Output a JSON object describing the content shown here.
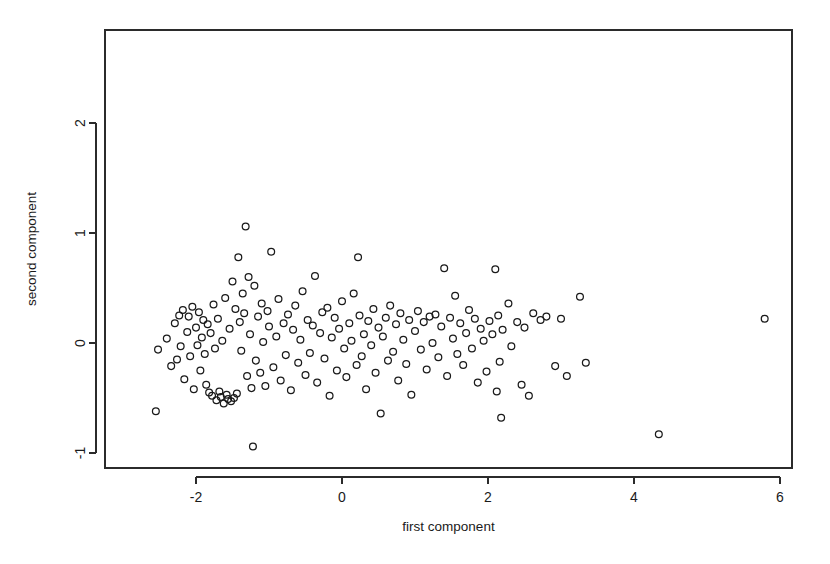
{
  "chart_data": {
    "type": "scatter",
    "title": "",
    "xlabel": "first component",
    "ylabel": "second component",
    "xlim": [
      -2.95,
      6.15
    ],
    "ylim": [
      -1.18,
      2.72
    ],
    "xticks": [
      -2,
      0,
      2,
      4,
      6
    ],
    "xticklabels": [
      "-2",
      "0",
      "2",
      "4",
      "6"
    ],
    "yticks": [
      -1,
      0,
      1,
      2
    ],
    "yticklabels": [
      "-1",
      "0",
      "1",
      "2"
    ],
    "grid": false,
    "legend": null,
    "marker": "open-circle",
    "marker_color": "#1a1a1a",
    "n_points": 176,
    "series": [
      {
        "name": "observations",
        "points": [
          [
            -2.52,
            -0.06
          ],
          [
            -2.55,
            -0.62
          ],
          [
            -2.4,
            0.04
          ],
          [
            -2.34,
            -0.21
          ],
          [
            -2.29,
            0.18
          ],
          [
            -2.26,
            -0.15
          ],
          [
            -2.23,
            0.25
          ],
          [
            -2.21,
            -0.03
          ],
          [
            -2.18,
            0.3
          ],
          [
            -2.16,
            -0.33
          ],
          [
            -2.12,
            0.1
          ],
          [
            -2.1,
            0.24
          ],
          [
            -2.08,
            -0.12
          ],
          [
            -2.05,
            0.33
          ],
          [
            -2.03,
            -0.42
          ],
          [
            -2.0,
            0.14
          ],
          [
            -1.98,
            -0.02
          ],
          [
            -1.96,
            0.28
          ],
          [
            -1.94,
            -0.25
          ],
          [
            -1.92,
            0.05
          ],
          [
            -1.9,
            0.21
          ],
          [
            -1.88,
            -0.1
          ],
          [
            -1.86,
            -0.38
          ],
          [
            -1.84,
            0.17
          ],
          [
            -1.82,
            -0.45
          ],
          [
            -1.8,
            0.09
          ],
          [
            -1.78,
            -0.48
          ],
          [
            -1.76,
            0.35
          ],
          [
            -1.74,
            -0.05
          ],
          [
            -1.72,
            -0.52
          ],
          [
            -1.7,
            0.22
          ],
          [
            -1.68,
            -0.44
          ],
          [
            -1.66,
            -0.49
          ],
          [
            -1.64,
            0.02
          ],
          [
            -1.62,
            -0.55
          ],
          [
            -1.6,
            0.41
          ],
          [
            -1.58,
            -0.47
          ],
          [
            -1.56,
            -0.51
          ],
          [
            -1.54,
            0.13
          ],
          [
            -1.52,
            -0.53
          ],
          [
            -1.5,
            0.56
          ],
          [
            -1.48,
            -0.5
          ],
          [
            -1.46,
            0.31
          ],
          [
            -1.44,
            -0.46
          ],
          [
            -1.42,
            0.78
          ],
          [
            -1.4,
            0.19
          ],
          [
            -1.38,
            -0.07
          ],
          [
            -1.36,
            0.45
          ],
          [
            -1.34,
            0.27
          ],
          [
            -1.32,
            1.06
          ],
          [
            -1.3,
            -0.3
          ],
          [
            -1.28,
            0.6
          ],
          [
            -1.26,
            0.08
          ],
          [
            -1.24,
            -0.41
          ],
          [
            -1.22,
            -0.94
          ],
          [
            -1.2,
            0.52
          ],
          [
            -1.18,
            -0.16
          ],
          [
            -1.15,
            0.24
          ],
          [
            -1.12,
            -0.27
          ],
          [
            -1.1,
            0.36
          ],
          [
            -1.08,
            0.01
          ],
          [
            -1.05,
            -0.39
          ],
          [
            -1.02,
            0.29
          ],
          [
            -1.0,
            0.15
          ],
          [
            -0.97,
            0.83
          ],
          [
            -0.94,
            -0.22
          ],
          [
            -0.9,
            0.06
          ],
          [
            -0.87,
            0.4
          ],
          [
            -0.84,
            -0.34
          ],
          [
            -0.8,
            0.18
          ],
          [
            -0.77,
            -0.11
          ],
          [
            -0.74,
            0.26
          ],
          [
            -0.7,
            -0.43
          ],
          [
            -0.67,
            0.12
          ],
          [
            -0.64,
            0.34
          ],
          [
            -0.6,
            -0.18
          ],
          [
            -0.57,
            0.03
          ],
          [
            -0.54,
            0.47
          ],
          [
            -0.5,
            -0.29
          ],
          [
            -0.47,
            0.21
          ],
          [
            -0.44,
            -0.09
          ],
          [
            -0.4,
            0.16
          ],
          [
            -0.37,
            0.61
          ],
          [
            -0.34,
            -0.36
          ],
          [
            -0.3,
            0.09
          ],
          [
            -0.27,
            0.28
          ],
          [
            -0.24,
            -0.14
          ],
          [
            -0.2,
            0.32
          ],
          [
            -0.17,
            -0.48
          ],
          [
            -0.14,
            0.05
          ],
          [
            -0.1,
            0.23
          ],
          [
            -0.07,
            -0.25
          ],
          [
            -0.04,
            0.13
          ],
          [
            0.0,
            0.38
          ],
          [
            0.03,
            -0.05
          ],
          [
            0.06,
            -0.31
          ],
          [
            0.1,
            0.18
          ],
          [
            0.13,
            0.02
          ],
          [
            0.16,
            0.45
          ],
          [
            0.2,
            -0.2
          ],
          [
            0.22,
            0.78
          ],
          [
            0.24,
            0.25
          ],
          [
            0.27,
            -0.12
          ],
          [
            0.3,
            0.08
          ],
          [
            0.33,
            -0.42
          ],
          [
            0.36,
            0.2
          ],
          [
            0.4,
            -0.02
          ],
          [
            0.43,
            0.31
          ],
          [
            0.46,
            -0.27
          ],
          [
            0.5,
            0.14
          ],
          [
            0.53,
            -0.64
          ],
          [
            0.56,
            0.06
          ],
          [
            0.6,
            0.23
          ],
          [
            0.63,
            -0.16
          ],
          [
            0.66,
            0.34
          ],
          [
            0.7,
            -0.08
          ],
          [
            0.74,
            0.17
          ],
          [
            0.77,
            -0.34
          ],
          [
            0.8,
            0.27
          ],
          [
            0.84,
            0.03
          ],
          [
            0.88,
            -0.19
          ],
          [
            0.92,
            0.21
          ],
          [
            0.95,
            -0.47
          ],
          [
            1.0,
            0.11
          ],
          [
            1.04,
            0.29
          ],
          [
            1.08,
            -0.06
          ],
          [
            1.12,
            0.19
          ],
          [
            1.16,
            -0.24
          ],
          [
            1.2,
            0.24
          ],
          [
            1.24,
            0.0
          ],
          [
            1.28,
            0.26
          ],
          [
            1.32,
            -0.13
          ],
          [
            1.36,
            0.15
          ],
          [
            1.4,
            0.68
          ],
          [
            1.44,
            -0.3
          ],
          [
            1.48,
            0.23
          ],
          [
            1.52,
            0.04
          ],
          [
            1.55,
            0.43
          ],
          [
            1.58,
            -0.1
          ],
          [
            1.62,
            0.18
          ],
          [
            1.66,
            -0.2
          ],
          [
            1.7,
            0.09
          ],
          [
            1.74,
            0.3
          ],
          [
            1.78,
            -0.05
          ],
          [
            1.82,
            0.22
          ],
          [
            1.86,
            -0.36
          ],
          [
            1.9,
            0.13
          ],
          [
            1.94,
            0.02
          ],
          [
            1.98,
            -0.26
          ],
          [
            2.02,
            0.2
          ],
          [
            2.06,
            0.08
          ],
          [
            2.1,
            0.67
          ],
          [
            2.12,
            -0.44
          ],
          [
            2.14,
            0.25
          ],
          [
            2.16,
            -0.17
          ],
          [
            2.18,
            -0.68
          ],
          [
            2.2,
            0.12
          ],
          [
            2.28,
            0.36
          ],
          [
            2.32,
            -0.03
          ],
          [
            2.4,
            0.19
          ],
          [
            2.46,
            -0.38
          ],
          [
            2.5,
            0.14
          ],
          [
            2.56,
            -0.48
          ],
          [
            2.62,
            0.27
          ],
          [
            2.72,
            0.21
          ],
          [
            2.8,
            0.24
          ],
          [
            2.92,
            -0.21
          ],
          [
            3.0,
            0.22
          ],
          [
            3.08,
            -0.3
          ],
          [
            3.26,
            0.42
          ],
          [
            3.34,
            -0.18
          ],
          [
            4.34,
            -0.83
          ],
          [
            5.79,
            0.22
          ]
        ]
      }
    ]
  },
  "plot_geometry": {
    "frame_left_px": 105,
    "frame_right_px": 792,
    "frame_top_px": 30,
    "frame_bottom_px": 468,
    "x_zero_px": 342,
    "y_zero_px": 343,
    "x_unit_px": 73,
    "y_unit_px": 110
  }
}
